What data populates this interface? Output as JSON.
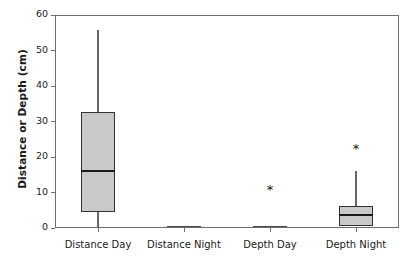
{
  "chart_data": {
    "type": "box",
    "title": "",
    "xlabel": "",
    "ylabel": "Distance or Depth (cm)",
    "ylim": [
      0,
      60
    ],
    "yticks": [
      0,
      10,
      20,
      30,
      40,
      50,
      60
    ],
    "grid": false,
    "legend": null,
    "categories": [
      "Distance Day",
      "Distance Night",
      "Depth Day",
      "Depth Night"
    ],
    "boxes": [
      {
        "category": "Distance Day",
        "whisker_low": 0.3,
        "q1": 4.5,
        "median": 16.0,
        "q3": 32.7,
        "whisker_high": 55.8,
        "outliers": [],
        "degenerate": false
      },
      {
        "category": "Distance Night",
        "whisker_low": 0.4,
        "q1": 0.4,
        "median": 0.4,
        "q3": 0.4,
        "whisker_high": 0.4,
        "outliers": [],
        "degenerate": true
      },
      {
        "category": "Depth Day",
        "whisker_low": 0.5,
        "q1": 0.5,
        "median": 0.5,
        "q3": 0.5,
        "whisker_high": 0.5,
        "outliers": [
          11.0
        ],
        "degenerate": true
      },
      {
        "category": "Depth Night",
        "whisker_low": 0.6,
        "q1": 0.6,
        "median": 3.7,
        "q3": 6.2,
        "whisker_high": 16.0,
        "outliers": [
          22.5
        ],
        "degenerate": false
      }
    ],
    "style": {
      "box_fill": "#c9c9c9",
      "box_edge": "#333333",
      "median_color": "#1a1a1a",
      "whisker_color": "#666666",
      "outlier_marker": "*",
      "frame_color": "#6e6e6e",
      "background": "#ffffff"
    }
  },
  "axis": {
    "y_title": "Distance or Depth (cm)",
    "y_tick_labels": [
      "0",
      "10",
      "20",
      "30",
      "40",
      "50",
      "60"
    ],
    "x_tick_labels": [
      "Distance Day",
      "Distance Night",
      "Depth Day",
      "Depth Night"
    ]
  }
}
